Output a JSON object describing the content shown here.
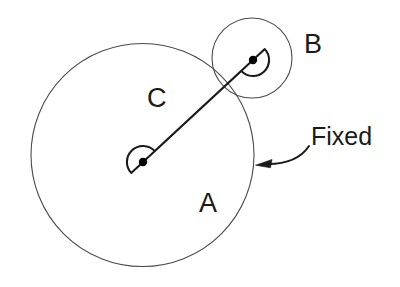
{
  "figure": {
    "type": "mechanism-diagram",
    "background_color": "#ffffff",
    "outline_color": "#4a4a4a",
    "link_color": "#1a1a1a",
    "joint_color": "#000000",
    "label_color": "#1a1a1a"
  },
  "labels": {
    "body_a": "A",
    "body_b": "B",
    "link_c": "C",
    "fixed": "Fixed"
  },
  "geometry": {
    "circle_a": {
      "cx": 142.5,
      "cy": 155,
      "r": 111.5
    },
    "circle_b": {
      "cx": 252,
      "cy": 58,
      "r": 40
    },
    "link_c": {
      "pivot_lower": {
        "x": 143,
        "y": 162
      },
      "pivot_upper": {
        "x": 253,
        "y": 60
      },
      "half_width": 16
    },
    "joint_dot_radius": 4.2,
    "fixed_arrow": {
      "tail": {
        "x": 309,
        "y": 146
      },
      "tip": {
        "x": 257,
        "y": 164
      }
    }
  }
}
